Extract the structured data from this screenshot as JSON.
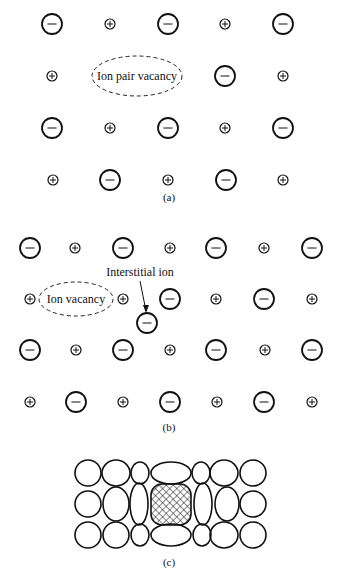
{
  "panel_a": {
    "caption": "(a)",
    "label": "Ion pair vacancy",
    "ions": [
      {
        "t": "-",
        "x": 52,
        "y": 24
      },
      {
        "t": "+",
        "x": 110,
        "y": 24
      },
      {
        "t": "-",
        "x": 168,
        "y": 24
      },
      {
        "t": "+",
        "x": 225,
        "y": 24
      },
      {
        "t": "-",
        "x": 283,
        "y": 24
      },
      {
        "t": "+",
        "x": 52,
        "y": 76
      },
      {
        "t": "-",
        "x": 225,
        "y": 76
      },
      {
        "t": "+",
        "x": 283,
        "y": 76
      },
      {
        "t": "-",
        "x": 52,
        "y": 128
      },
      {
        "t": "+",
        "x": 110,
        "y": 128
      },
      {
        "t": "-",
        "x": 168,
        "y": 128
      },
      {
        "t": "+",
        "x": 225,
        "y": 128
      },
      {
        "t": "-",
        "x": 283,
        "y": 128
      },
      {
        "t": "+",
        "x": 53,
        "y": 180
      },
      {
        "t": "-",
        "x": 110,
        "y": 180
      },
      {
        "t": "+",
        "x": 168,
        "y": 180
      },
      {
        "t": "-",
        "x": 226,
        "y": 180
      },
      {
        "t": "+",
        "x": 283,
        "y": 180
      }
    ]
  },
  "panel_b": {
    "caption": "(b)",
    "vacancy_label": "Ion vacancy",
    "interstitial_label": "Interstitial ion",
    "ions": [
      {
        "t": "-",
        "x": 30,
        "y": 248
      },
      {
        "t": "+",
        "x": 75,
        "y": 248
      },
      {
        "t": "-",
        "x": 123,
        "y": 248
      },
      {
        "t": "+",
        "x": 170,
        "y": 248
      },
      {
        "t": "-",
        "x": 216,
        "y": 248
      },
      {
        "t": "+",
        "x": 264,
        "y": 248
      },
      {
        "t": "-",
        "x": 312,
        "y": 248
      },
      {
        "t": "+",
        "x": 30,
        "y": 299
      },
      {
        "t": "+",
        "x": 123,
        "y": 299
      },
      {
        "t": "-",
        "x": 170,
        "y": 299
      },
      {
        "t": "+",
        "x": 216,
        "y": 299
      },
      {
        "t": "-",
        "x": 264,
        "y": 299
      },
      {
        "t": "+",
        "x": 312,
        "y": 299
      },
      {
        "t": "-",
        "x": 147,
        "y": 323
      },
      {
        "t": "-",
        "x": 30,
        "y": 350
      },
      {
        "t": "+",
        "x": 76,
        "y": 350
      },
      {
        "t": "-",
        "x": 123,
        "y": 350
      },
      {
        "t": "+",
        "x": 170,
        "y": 350
      },
      {
        "t": "-",
        "x": 216,
        "y": 350
      },
      {
        "t": "+",
        "x": 265,
        "y": 350
      },
      {
        "t": "-",
        "x": 312,
        "y": 350
      },
      {
        "t": "+",
        "x": 30,
        "y": 402
      },
      {
        "t": "-",
        "x": 76,
        "y": 402
      },
      {
        "t": "+",
        "x": 123,
        "y": 402
      },
      {
        "t": "-",
        "x": 170,
        "y": 402
      },
      {
        "t": "+",
        "x": 217,
        "y": 402
      },
      {
        "t": "-",
        "x": 264,
        "y": 402
      },
      {
        "t": "+",
        "x": 312,
        "y": 402
      }
    ]
  },
  "panel_c": {
    "caption": "(c)"
  }
}
